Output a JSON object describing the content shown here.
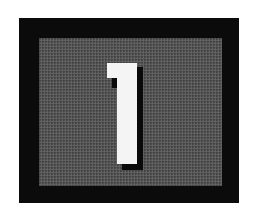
{
  "panel": {
    "number": "1",
    "colors": {
      "background": "#ffffff",
      "frame": "#0b0b0b",
      "panel": "#575757",
      "numeral": "#f4f4f4",
      "shadow": "#0a0a0a"
    }
  }
}
